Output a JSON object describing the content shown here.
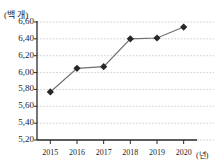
{
  "chart_data": {
    "type": "line",
    "title": "",
    "subtitle": "",
    "xlabel": "(년)",
    "ylabel": "(백 개)",
    "y_unit_label": "(백 개)",
    "x_unit_label": "(년)",
    "categories": [
      "2015",
      "2016",
      "2017",
      "2018",
      "2019",
      "2020"
    ],
    "x": [
      2015,
      2016,
      2017,
      2018,
      2019,
      2020
    ],
    "values": [
      5.77,
      6.05,
      6.07,
      6.4,
      6.41,
      6.54
    ],
    "value_labels": [
      "5,77",
      "6,05",
      "6,07",
      "6,40",
      "6,41",
      "6,54"
    ],
    "ylim": [
      5.2,
      6.6
    ],
    "ytick_values": [
      5.2,
      5.4,
      5.6,
      5.8,
      6.0,
      6.2,
      6.4,
      6.6
    ],
    "ytick_labels": [
      "5,20",
      "5,40",
      "5,60",
      "5,80",
      "6,00",
      "6,20",
      "6,40",
      "6,60"
    ],
    "xtick_labels": [
      "2015",
      "2016",
      "2017",
      "2018",
      "2019",
      "2020"
    ],
    "grid": true,
    "grid_style": "dotted",
    "legend": null,
    "legend_position": "none",
    "marker": "diamond",
    "decimal_separator": ",",
    "colors": {
      "line": "#6f6f6f",
      "marker": "#272727",
      "grid": "#c9c9c9",
      "axis": "#2a2a2a",
      "text": "#1d1d1d",
      "background": "#ffffff"
    }
  },
  "top_cutoff": {
    "text": "· · · · · · · · · · · · · · · · · · · · · ·"
  }
}
